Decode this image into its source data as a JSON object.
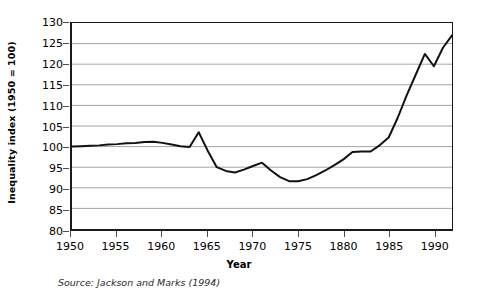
{
  "chart_data": {
    "type": "line",
    "title": "",
    "xlabel": "Year",
    "ylabel": "Inequality index (1950 = 100)",
    "xlim": [
      1950,
      1992
    ],
    "ylim": [
      80,
      130
    ],
    "ytick_step": 5,
    "xtick_step": 5,
    "grid": "horizontal",
    "legend": "none",
    "yticks": [
      80,
      85,
      90,
      95,
      100,
      105,
      110,
      115,
      120,
      125,
      130
    ],
    "ytick_labels": [
      "80",
      "85",
      "90",
      "95",
      "100",
      "105",
      "110",
      "115",
      "120",
      "125",
      "130"
    ],
    "xticks": [
      1950,
      1955,
      1960,
      1965,
      1970,
      1975,
      1980,
      1985,
      1990
    ],
    "xtick_labels": [
      "1950",
      "1955",
      "1960",
      "1965",
      "1970",
      "1975",
      "1880",
      "1985",
      "1990"
    ],
    "series": [
      {
        "name": "Inequality index",
        "color": "#111111",
        "x": [
          1950,
          1951,
          1952,
          1953,
          1954,
          1955,
          1956,
          1957,
          1958,
          1959,
          1960,
          1961,
          1962,
          1963,
          1964,
          1965,
          1966,
          1967,
          1968,
          1969,
          1970,
          1971,
          1972,
          1973,
          1974,
          1975,
          1976,
          1977,
          1978,
          1979,
          1980,
          1981,
          1982,
          1983,
          1984,
          1985,
          1986,
          1987,
          1988,
          1989,
          1990,
          1991,
          1992
        ],
        "values": [
          100.0,
          100.1,
          100.2,
          100.3,
          100.5,
          100.6,
          100.8,
          100.9,
          101.1,
          101.2,
          100.9,
          100.5,
          100.1,
          99.9,
          103.5,
          99.0,
          95.0,
          94.1,
          93.7,
          94.4,
          95.3,
          96.1,
          94.2,
          92.6,
          91.6,
          91.6,
          92.1,
          93.1,
          94.2,
          95.5,
          96.9,
          98.7,
          98.8,
          98.8,
          100.3,
          102.2,
          107.0,
          112.5,
          117.5,
          122.5,
          119.5,
          124.0,
          127.0
        ]
      }
    ],
    "annotations": {
      "source": "Source: Jackson and Marks (1994)"
    }
  },
  "axis": {
    "y_title": "Inequality index (1950 = 100)",
    "x_title": "Year"
  },
  "footer": {
    "source": "Source: Jackson and Marks (1994)"
  }
}
